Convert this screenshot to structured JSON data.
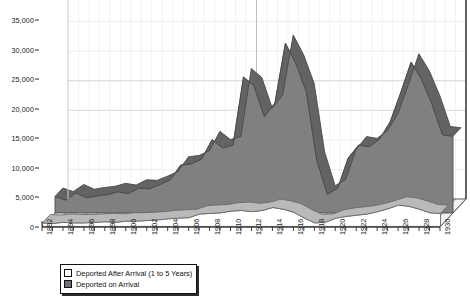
{
  "chart_data": {
    "type": "area",
    "title": "",
    "subtitle": "",
    "xlabel": "",
    "ylabel": "",
    "ylim": [
      0,
      35000
    ],
    "ytick_step": 5000,
    "grid": true,
    "legend_position": "bottom-left",
    "projection": "3d-stacked-area",
    "ytick_labels": [
      "0",
      "5,000",
      "10,000",
      "15,000",
      "20,000",
      "25,000",
      "30,000",
      "35,000"
    ],
    "ytick_values": [
      0,
      5000,
      10000,
      15000,
      20000,
      25000,
      30000,
      35000
    ],
    "xtick_labels": [
      "1892",
      "1894",
      "1896",
      "1898",
      "1900",
      "1902",
      "1904",
      "1906",
      "1908",
      "1910",
      "1912",
      "1914",
      "1916",
      "1918",
      "1920",
      "1922",
      "1924",
      "1926",
      "1928",
      "1930"
    ],
    "x": [
      1892,
      1893,
      1894,
      1895,
      1896,
      1897,
      1898,
      1899,
      1900,
      1901,
      1902,
      1903,
      1904,
      1905,
      1906,
      1907,
      1908,
      1909,
      1910,
      1911,
      1912,
      1913,
      1914,
      1915,
      1916,
      1917,
      1918,
      1919,
      1920,
      1921,
      1922,
      1923,
      1924,
      1925,
      1926,
      1927,
      1928,
      1929,
      1930
    ],
    "series": [
      {
        "name": "Deported on  Arrival",
        "color": "#808080",
        "edge_color": "#4a4a4a",
        "values": [
          2800,
          2200,
          3400,
          2600,
          2900,
          3100,
          3600,
          3300,
          4200,
          4100,
          4800,
          5600,
          8100,
          8300,
          9100,
          12400,
          11000,
          11500,
          23000,
          21500,
          16300,
          18600,
          28700,
          25300,
          20500,
          8900,
          3200,
          4200,
          9300,
          11500,
          11200,
          12500,
          15400,
          20300,
          25500,
          22600,
          18400,
          13200,
          13000
        ]
      },
      {
        "name": "Deported After Arrival (1 to 5 Years)",
        "color": "#ffffff",
        "edge_color": "#6a6a6a",
        "values": [
          600,
          500,
          700,
          600,
          600,
          700,
          800,
          700,
          900,
          900,
          1000,
          1100,
          1300,
          1400,
          1500,
          2100,
          2200,
          2300,
          2600,
          2700,
          2500,
          2700,
          3200,
          2900,
          2400,
          1400,
          600,
          700,
          1400,
          1700,
          1900,
          2100,
          2500,
          3000,
          3600,
          3400,
          2900,
          2300,
          2200
        ]
      }
    ]
  },
  "legend": {
    "items": [
      {
        "label": "Deported After Arrival (1 to 5 Years)",
        "swatch": "hollow"
      },
      {
        "label": "Deported on  Arrival",
        "swatch": "filled"
      }
    ]
  },
  "colors": {
    "area_fill": "#808080",
    "area_edge": "#4a4a4a",
    "front_fill": "#ffffff",
    "axis": "#2a2a2a",
    "grid": "#e8e8e8",
    "text": "#111111"
  }
}
